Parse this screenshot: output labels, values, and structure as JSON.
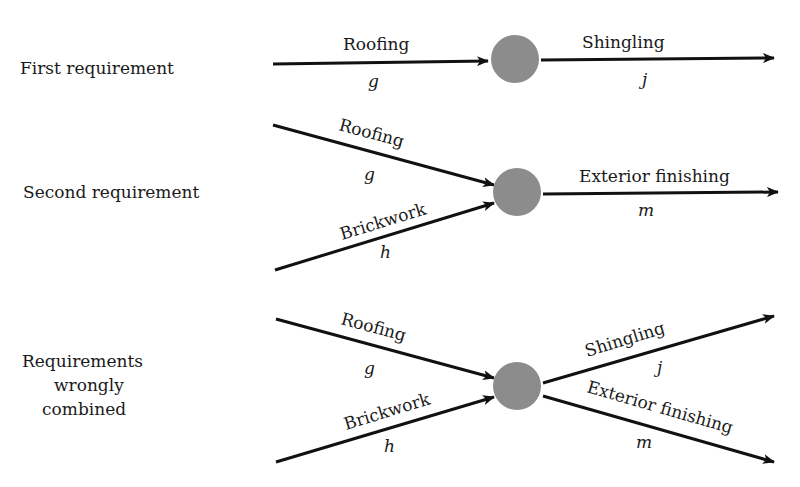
{
  "rows": [
    {
      "label": "First requirement",
      "incoming": [
        {
          "activity": "Roofing",
          "variable": "g"
        }
      ],
      "outgoing": [
        {
          "activity": "Shingling",
          "variable": "j"
        }
      ]
    },
    {
      "label": "Second requirement",
      "incoming": [
        {
          "activity": "Roofing",
          "variable": "g"
        },
        {
          "activity": "Brickwork",
          "variable": "h"
        }
      ],
      "outgoing": [
        {
          "activity": "Exterior finishing",
          "variable": "m"
        }
      ]
    },
    {
      "label_lines": [
        "Requirements",
        "wrongly",
        "combined"
      ],
      "incoming": [
        {
          "activity": "Roofing",
          "variable": "g"
        },
        {
          "activity": "Brickwork",
          "variable": "h"
        }
      ],
      "outgoing": [
        {
          "activity": "Shingling",
          "variable": "j"
        },
        {
          "activity": "Exterior finishing",
          "variable": "m"
        }
      ]
    }
  ],
  "colors": {
    "node": "#8c8c8c",
    "edge": "#111111",
    "text": "#1a1a1a"
  }
}
